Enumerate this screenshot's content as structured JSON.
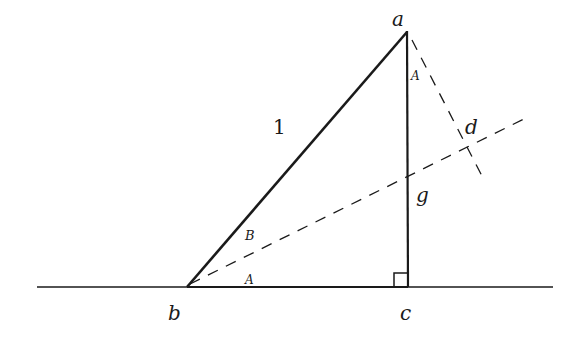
{
  "diagram": {
    "type": "geometry",
    "points": {
      "a": {
        "label": "a",
        "x": 407,
        "y": 32
      },
      "b": {
        "label": "b",
        "x": 187,
        "y": 287
      },
      "c": {
        "label": "c",
        "x": 408,
        "y": 287
      },
      "d": {
        "label": "d",
        "x": 466,
        "y": 150
      }
    },
    "labels": {
      "vertex_a": "a",
      "vertex_b": "b",
      "vertex_c": "c",
      "point_d": "d",
      "hypotenuse": "1",
      "side_g": "g",
      "angle_at_a": "A",
      "angle_B_at_b": "B",
      "angle_A_at_b": "A"
    },
    "colors": {
      "stroke": "#1a1a1a",
      "background": "#ffffff"
    }
  }
}
